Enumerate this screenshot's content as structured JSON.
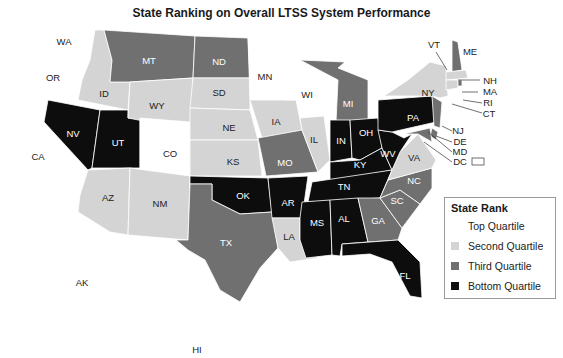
{
  "title": "State Ranking on Overall LTSS System Performance",
  "colors": {
    "top": "#ffffff",
    "second": "#d4d4d4",
    "third": "#707070",
    "bottom": "#0d0d0d"
  },
  "legend": {
    "title": "State Rank",
    "items": [
      {
        "label": "Top Quartile",
        "key": "top",
        "color": "#ffffff"
      },
      {
        "label": "Second Quartile",
        "key": "second",
        "color": "#d4d4d4"
      },
      {
        "label": "Third Quartile",
        "key": "third",
        "color": "#707070"
      },
      {
        "label": "Bottom Quartile",
        "key": "bottom",
        "color": "#0d0d0d"
      }
    ]
  },
  "states": {
    "WA": "top",
    "OR": "top",
    "CA": "top",
    "ID": "second",
    "NV": "bottom",
    "UT": "bottom",
    "AZ": "second",
    "MT": "third",
    "WY": "second",
    "CO": "top",
    "NM": "second",
    "ND": "third",
    "SD": "second",
    "NE": "second",
    "KS": "second",
    "OK": "bottom",
    "TX": "third",
    "MN": "top",
    "IA": "second",
    "MO": "third",
    "AR": "bottom",
    "LA": "second",
    "WI": "top",
    "IL": "second",
    "MI": "third",
    "IN": "bottom",
    "OH": "bottom",
    "KY": "bottom",
    "TN": "bottom",
    "MS": "bottom",
    "AL": "bottom",
    "GA": "third",
    "FL": "bottom",
    "SC": "third",
    "NC": "third",
    "VA": "second",
    "WV": "bottom",
    "PA": "bottom",
    "NY": "second",
    "VT": "top",
    "NH": "third",
    "ME": "top",
    "MA": "second",
    "RI": "third",
    "CT": "second",
    "NJ": "third",
    "DE": "third",
    "MD": "third",
    "DC": "top",
    "AK": "top",
    "HI": "top"
  },
  "labels": {
    "WA": "WA",
    "OR": "OR",
    "CA": "CA",
    "ID": "ID",
    "NV": "NV",
    "UT": "UT",
    "AZ": "AZ",
    "MT": "MT",
    "WY": "WY",
    "CO": "CO",
    "NM": "NM",
    "ND": "ND",
    "SD": "SD",
    "NE": "NE",
    "KS": "KS",
    "OK": "OK",
    "TX": "TX",
    "MN": "MN",
    "IA": "IA",
    "MO": "MO",
    "AR": "AR",
    "LA": "LA",
    "WI": "WI",
    "IL": "IL",
    "MI": "MI",
    "IN": "IN",
    "OH": "OH",
    "KY": "KY",
    "TN": "TN",
    "MS": "MS",
    "AL": "AL",
    "GA": "GA",
    "FL": "FL",
    "SC": "SC",
    "NC": "NC",
    "VA": "VA",
    "WV": "WV",
    "PA": "PA",
    "NY": "NY",
    "VT": "VT",
    "NH": "NH",
    "ME": "ME",
    "MA": "MA",
    "RI": "RI",
    "CT": "CT",
    "NJ": "NJ",
    "DE": "DE",
    "MD": "MD",
    "DC": "DC",
    "AK": "AK",
    "HI": "HI"
  }
}
